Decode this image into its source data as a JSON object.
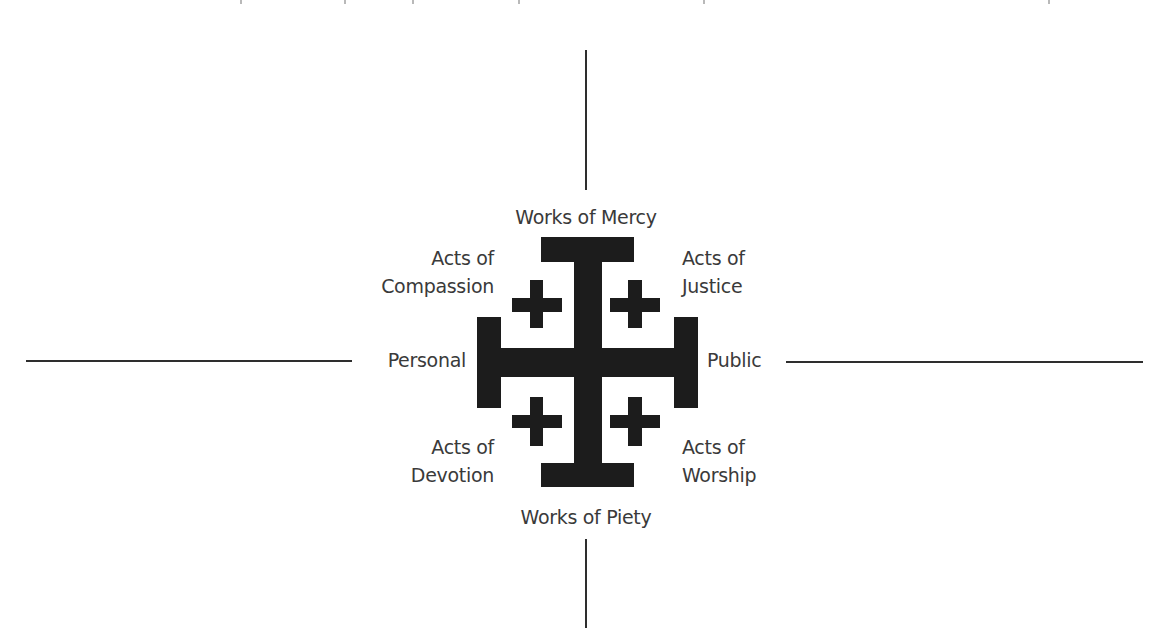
{
  "diagram": {
    "type": "quadrant-cross-diagram",
    "symbol": "jerusalem-cross",
    "colors": {
      "background": "#ffffff",
      "cross": "#1c1c1c",
      "text": "#3a3a3a",
      "axis_lines": "#2e2e2e"
    },
    "axes": {
      "top": "Works of Mercy",
      "bottom": "Works of Piety",
      "left": "Personal",
      "right": "Public"
    },
    "quadrants": {
      "top_left": {
        "line1": "Acts of",
        "line2": "Compassion"
      },
      "top_right": {
        "line1": "Acts of",
        "line2": "Justice"
      },
      "bottom_left": {
        "line1": "Acts of",
        "line2": "Devotion"
      },
      "bottom_right": {
        "line1": "Acts of",
        "line2": "Worship"
      }
    }
  }
}
